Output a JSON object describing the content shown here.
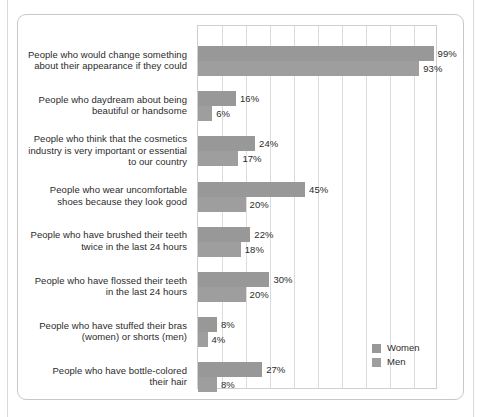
{
  "chart_data": {
    "type": "bar",
    "orientation": "horizontal",
    "title": "",
    "xlabel": "",
    "ylabel": "",
    "xlim": [
      0,
      100
    ],
    "xunit": "%",
    "grid": true,
    "gridline_count": 9,
    "gridline_step": 10,
    "legend_position": "bottom-right",
    "categories": [
      "People who would change something about their appearance if they could",
      "People who daydream about being beautiful or handsome",
      "People who think that the cosmetics industry is very important or essential to our country",
      "People who wear uncomfortable shoes because they look good",
      "People who have brushed their teeth twice in the last 24 hours",
      "People who have flossed their teeth in the last 24 hours",
      "People who have stuffed their bras (women) or shorts (men)",
      "People who have bottle-colored their hair"
    ],
    "series": [
      {
        "name": "Women",
        "color": "#989898",
        "values": [
          99,
          16,
          24,
          45,
          22,
          30,
          8,
          27
        ],
        "value_labels": [
          "99%",
          "16%",
          "24%",
          "45%",
          "22%",
          "30%",
          "8%",
          "27%"
        ]
      },
      {
        "name": "Men",
        "color": "#9e9e9e",
        "values": [
          93,
          6,
          17,
          20,
          18,
          20,
          4,
          8
        ],
        "value_labels": [
          "93%",
          "6%",
          "17%",
          "20%",
          "18%",
          "20%",
          "4%",
          "8%"
        ]
      }
    ]
  },
  "rows": [
    {
      "label_lines": [
        "People who would change something",
        "about their appearance if they could"
      ],
      "women": {
        "value": 99,
        "label": "99%"
      },
      "men": {
        "value": 93,
        "label": "93%"
      }
    },
    {
      "label_lines": [
        "People who daydream about being",
        "beautiful or handsome"
      ],
      "women": {
        "value": 16,
        "label": "16%"
      },
      "men": {
        "value": 6,
        "label": "6%"
      }
    },
    {
      "label_lines": [
        "People who think that the cosmetics",
        "industry is very important or essential",
        "to our country"
      ],
      "women": {
        "value": 24,
        "label": "24%"
      },
      "men": {
        "value": 17,
        "label": "17%"
      }
    },
    {
      "label_lines": [
        "People who wear uncomfortable",
        "shoes because they look good"
      ],
      "women": {
        "value": 45,
        "label": "45%"
      },
      "men": {
        "value": 20,
        "label": "20%"
      }
    },
    {
      "label_lines": [
        "People who have brushed their teeth",
        "twice in the last 24 hours"
      ],
      "women": {
        "value": 22,
        "label": "22%"
      },
      "men": {
        "value": 18,
        "label": "18%"
      }
    },
    {
      "label_lines": [
        "People who have flossed their teeth",
        "in the last 24 hours"
      ],
      "women": {
        "value": 30,
        "label": "30%"
      },
      "men": {
        "value": 20,
        "label": "20%"
      }
    },
    {
      "label_lines": [
        "People who have stuffed their bras",
        "(women) or shorts (men)"
      ],
      "women": {
        "value": 8,
        "label": "8%"
      },
      "men": {
        "value": 4,
        "label": "4%"
      }
    },
    {
      "label_lines": [
        "People who have bottle-colored",
        "their hair"
      ],
      "women": {
        "value": 27,
        "label": "27%"
      },
      "men": {
        "value": 8,
        "label": "8%"
      }
    }
  ],
  "legend": {
    "items": [
      {
        "label": "Women",
        "color": "#989898"
      },
      {
        "label": "Men",
        "color": "#9e9e9e"
      }
    ]
  },
  "colors": {
    "women_bar": "#989898",
    "men_bar": "#9e9e9e",
    "gridline": "#dcdcdc",
    "plot_border": "#cfcfcf",
    "panel_border": "#c8c8c8",
    "text": "#2b2b2b",
    "background": "#ffffff"
  }
}
